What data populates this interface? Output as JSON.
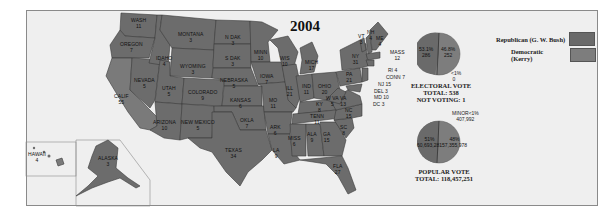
{
  "title": "2004",
  "legend": {
    "republican": {
      "label": "Republican (G. W. Bush)",
      "color": "#6a6a6a"
    },
    "democratic": {
      "label": "Democratic (Kerry)",
      "color": "#7d7d7d"
    }
  },
  "electoral_pie": {
    "rep_pct": "53.1%",
    "rep_votes": "286",
    "dem_pct": "46.8%",
    "dem_votes": "252",
    "minor_pct": "<1%",
    "minor_votes": "0",
    "caption_title": "ELECTORAL VOTE",
    "caption_total": "TOTAL: 538",
    "caption_not_voting": "NOT VOTING: 1"
  },
  "popular_pie": {
    "rep_pct": "51%",
    "rep_votes": "62,040,610",
    "dem_pct": "48%",
    "dem_votes": "59,028,439",
    "minor_label": "MINOR<1%",
    "minor_votes": "465,151",
    "dem_votes_display": "57,355,978",
    "minor_votes_display": "407,992",
    "rep_votes_display": "60,693,281",
    "caption_title": "POPULAR VOTE",
    "caption_total": "TOTAL: 118,457,251"
  },
  "states": [
    {
      "name": "WASH",
      "ev": "11"
    },
    {
      "name": "OREGON",
      "ev": "7"
    },
    {
      "name": "CALIF",
      "ev": "55"
    },
    {
      "name": "NEVADA",
      "ev": "5"
    },
    {
      "name": "IDAHO",
      "ev": "4"
    },
    {
      "name": "MONTANA",
      "ev": "3"
    },
    {
      "name": "WYOMING",
      "ev": "3"
    },
    {
      "name": "UTAH",
      "ev": "5"
    },
    {
      "name": "ARIZONA",
      "ev": "10"
    },
    {
      "name": "COLORADO",
      "ev": "9"
    },
    {
      "name": "NEW MEXICO",
      "ev": "5"
    },
    {
      "name": "N DAK",
      "ev": "3"
    },
    {
      "name": "S DAK",
      "ev": "3"
    },
    {
      "name": "NEBRASKA",
      "ev": "5"
    },
    {
      "name": "KANSAS",
      "ev": "6"
    },
    {
      "name": "OKLA",
      "ev": "7"
    },
    {
      "name": "TEXAS",
      "ev": "34"
    },
    {
      "name": "MINN",
      "ev": "10"
    },
    {
      "name": "IOWA",
      "ev": "7"
    },
    {
      "name": "MO",
      "ev": "11"
    },
    {
      "name": "ARK",
      "ev": "6"
    },
    {
      "name": "LA",
      "ev": "9"
    },
    {
      "name": "WIS",
      "ev": "10"
    },
    {
      "name": "ILL",
      "ev": "21"
    },
    {
      "name": "MICH",
      "ev": "17"
    },
    {
      "name": "IND",
      "ev": "11"
    },
    {
      "name": "OHIO",
      "ev": "20"
    },
    {
      "name": "KY",
      "ev": "8"
    },
    {
      "name": "TENN",
      "ev": "11"
    },
    {
      "name": "MISS",
      "ev": "6"
    },
    {
      "name": "ALA",
      "ev": "9"
    },
    {
      "name": "GA",
      "ev": "15"
    },
    {
      "name": "FLA",
      "ev": "27"
    },
    {
      "name": "SC",
      "ev": "8"
    },
    {
      "name": "NC",
      "ev": "15"
    },
    {
      "name": "VA",
      "ev": "13"
    },
    {
      "name": "W VA",
      "ev": "5"
    },
    {
      "name": "PA",
      "ev": "21"
    },
    {
      "name": "NY",
      "ev": "31"
    },
    {
      "name": "VT",
      "ev": "3"
    },
    {
      "name": "NH",
      "ev": "4"
    },
    {
      "name": "ME",
      "ev": "4"
    },
    {
      "name": "MASS",
      "ev": "12"
    },
    {
      "name": "RI",
      "ev": "4"
    },
    {
      "name": "CONN",
      "ev": "7"
    },
    {
      "name": "NJ",
      "ev": "15"
    },
    {
      "name": "DEL",
      "ev": "3"
    },
    {
      "name": "MD",
      "ev": "10"
    },
    {
      "name": "DC",
      "ev": "3"
    },
    {
      "name": "HAWAII",
      "ev": "4"
    },
    {
      "name": "ALASKA",
      "ev": "3"
    }
  ]
}
